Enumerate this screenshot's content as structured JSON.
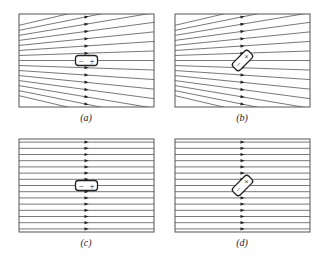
{
  "figure": {
    "line_color": "#555555",
    "frame_color": "#555555",
    "dipole_color": "#222222",
    "panels": [
      {
        "id": "a",
        "caption": "(a)",
        "field": "nonuniform",
        "dipole": "aligned",
        "x": 19,
        "y": 14,
        "w": 135,
        "h": 93,
        "charges": [
          "−",
          "+"
        ]
      },
      {
        "id": "b",
        "caption": "(b)",
        "field": "nonuniform",
        "dipole": "tilted",
        "x": 175,
        "y": 14,
        "w": 135,
        "h": 93,
        "charges": [
          "−",
          "+"
        ]
      },
      {
        "id": "c",
        "caption": "(c)",
        "field": "uniform",
        "dipole": "aligned",
        "x": 19,
        "y": 139,
        "w": 135,
        "h": 93,
        "charges": [
          "−",
          "+"
        ]
      },
      {
        "id": "d",
        "caption": "(d)",
        "field": "uniform",
        "dipole": "tilted",
        "x": 175,
        "y": 139,
        "w": 135,
        "h": 93,
        "charges": [
          "−",
          "+"
        ]
      }
    ]
  }
}
